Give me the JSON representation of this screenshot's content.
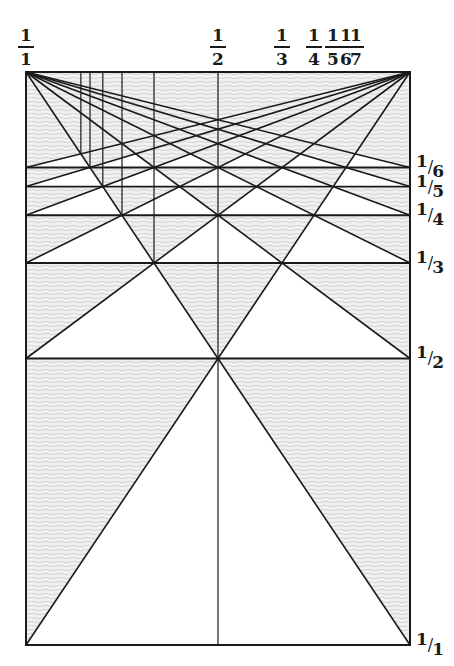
{
  "diagram": {
    "colors": {
      "line": "#1a1a1a",
      "hatch_bg": "#f1f1f1",
      "hatch_stroke": "#c9c9c9",
      "white": "#ffffff"
    },
    "rect": {
      "x": 26,
      "y": 72,
      "width": 384,
      "height": 573
    },
    "divisions": [
      1,
      2,
      3,
      4,
      5,
      6
    ],
    "vertical_divisions": [
      2,
      3,
      4,
      5,
      6,
      7
    ],
    "column_labels": [
      {
        "num": "1",
        "den": "1",
        "x": 26
      },
      {
        "num": "1",
        "den": "2",
        "x": 218
      },
      {
        "num": "1",
        "den": "3",
        "x": 282
      },
      {
        "num": "1",
        "den": "4",
        "x": 314
      },
      {
        "num": "1",
        "den": "5",
        "x": 333
      },
      {
        "num": "1",
        "den": "6",
        "x": 346
      },
      {
        "num": "1",
        "den": "7",
        "x": 356
      }
    ],
    "row_labels": [
      {
        "num": "1",
        "den": "6",
        "y": 167
      },
      {
        "num": "1",
        "den": "5",
        "y": 187
      },
      {
        "num": "1",
        "den": "4",
        "y": 215
      },
      {
        "num": "1",
        "den": "3",
        "y": 263
      },
      {
        "num": "1",
        "den": "2",
        "y": 358
      },
      {
        "num": "1",
        "den": "1",
        "y": 645
      }
    ]
  }
}
